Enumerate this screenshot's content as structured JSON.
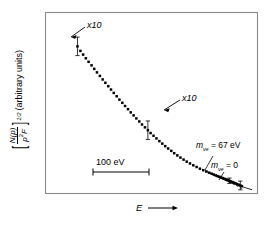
{
  "figure": {
    "type": "kurie-plot",
    "background": "#ffffff",
    "frame_color": "#808080",
    "data_color": "#000000"
  },
  "axes": {
    "y_label_parts": {
      "bracket_open": "[",
      "numerator": "N(p)",
      "denominator_p": "p",
      "denominator_sup": "2",
      "denominator_F": "F",
      "bracket_close": "]",
      "exponent": "1/2",
      "units": "(arbitrary units)"
    },
    "y_label_text": "[ N(p) / p²F ]^(1/2) (arbitrary units)",
    "x_label": "E",
    "x_label_arrow": "⟶"
  },
  "annotations": {
    "multiplier_upper": "x10",
    "multiplier_middle": "x10",
    "scalebar_label": "100 eV",
    "mass_curve_1": {
      "symbol": "m",
      "sub": "ν",
      "subsub": "e",
      "equals": " = 67 eV",
      "text": "mνe = 67 eV"
    },
    "mass_curve_2": {
      "symbol": "m",
      "sub": "ν",
      "subsub": "e",
      "equals": " = 0",
      "text": "mνe = 0"
    }
  },
  "chart_data": {
    "type": "scatter",
    "title": "",
    "xlabel": "E",
    "ylabel": "[N(p)/p²F]^(1/2) (arbitrary units)",
    "grid": false,
    "legend": false,
    "xlim": [
      0,
      100
    ],
    "ylim": [
      0,
      100
    ],
    "points": [
      {
        "x": 10.5,
        "y": 85.5
      },
      {
        "x": 12.0,
        "y": 82.8
      },
      {
        "x": 13.4,
        "y": 80.6
      },
      {
        "x": 14.8,
        "y": 78.4
      },
      {
        "x": 16.2,
        "y": 76.3
      },
      {
        "x": 17.7,
        "y": 74.2
      },
      {
        "x": 19.1,
        "y": 72.1
      },
      {
        "x": 20.5,
        "y": 70.0
      },
      {
        "x": 22.0,
        "y": 67.9
      },
      {
        "x": 23.4,
        "y": 65.8
      },
      {
        "x": 24.8,
        "y": 63.8
      },
      {
        "x": 26.3,
        "y": 61.8
      },
      {
        "x": 27.7,
        "y": 59.8
      },
      {
        "x": 29.1,
        "y": 57.8
      },
      {
        "x": 30.6,
        "y": 55.8
      },
      {
        "x": 32.0,
        "y": 53.8
      },
      {
        "x": 33.5,
        "y": 51.9
      },
      {
        "x": 34.9,
        "y": 50.0
      },
      {
        "x": 36.4,
        "y": 48.1
      },
      {
        "x": 37.8,
        "y": 46.2
      },
      {
        "x": 39.3,
        "y": 44.4
      },
      {
        "x": 40.7,
        "y": 42.6
      },
      {
        "x": 42.2,
        "y": 40.8
      },
      {
        "x": 43.6,
        "y": 39.0
      },
      {
        "x": 45.1,
        "y": 37.3
      },
      {
        "x": 46.6,
        "y": 35.6
      },
      {
        "x": 48.0,
        "y": 33.9
      },
      {
        "x": 49.5,
        "y": 32.3
      },
      {
        "x": 51.0,
        "y": 30.7
      },
      {
        "x": 52.5,
        "y": 29.1
      },
      {
        "x": 54.0,
        "y": 27.6
      },
      {
        "x": 55.5,
        "y": 26.1
      },
      {
        "x": 57.0,
        "y": 24.7
      },
      {
        "x": 58.6,
        "y": 23.3
      },
      {
        "x": 60.1,
        "y": 21.9
      },
      {
        "x": 61.7,
        "y": 20.6
      },
      {
        "x": 63.3,
        "y": 19.3
      },
      {
        "x": 64.9,
        "y": 18.1
      },
      {
        "x": 66.5,
        "y": 16.9
      },
      {
        "x": 68.2,
        "y": 15.8
      },
      {
        "x": 69.9,
        "y": 14.7
      },
      {
        "x": 71.6,
        "y": 13.7
      },
      {
        "x": 73.3,
        "y": 12.7
      },
      {
        "x": 75.0,
        "y": 11.8
      },
      {
        "x": 76.6,
        "y": 11.0
      },
      {
        "x": 78.0,
        "y": 10.3
      },
      {
        "x": 79.3,
        "y": 9.7
      },
      {
        "x": 80.4,
        "y": 9.2
      },
      {
        "x": 81.4,
        "y": 8.7
      },
      {
        "x": 82.3,
        "y": 8.3
      },
      {
        "x": 83.2,
        "y": 7.9
      },
      {
        "x": 84.1,
        "y": 7.5
      },
      {
        "x": 85.0,
        "y": 7.1
      },
      {
        "x": 85.9,
        "y": 6.7
      },
      {
        "x": 86.8,
        "y": 6.3
      },
      {
        "x": 87.6,
        "y": 5.9
      },
      {
        "x": 88.4,
        "y": 5.5
      },
      {
        "x": 89.2,
        "y": 5.1
      },
      {
        "x": 90.0,
        "y": 4.7
      },
      {
        "x": 90.8,
        "y": 4.3
      },
      {
        "x": 91.6,
        "y": 3.9
      },
      {
        "x": 92.4,
        "y": 3.5
      },
      {
        "x": 93.2,
        "y": 3.1
      },
      {
        "x": 94.0,
        "y": 2.7
      },
      {
        "x": 94.8,
        "y": 2.3
      }
    ],
    "error_bars": [
      {
        "x": 10.5,
        "y": 85.5,
        "err": 5.5
      },
      {
        "x": 46.6,
        "y": 35.6,
        "err": 5.5
      },
      {
        "x": 94.0,
        "y": 2.7,
        "err": 2.6
      },
      {
        "x": 88.4,
        "y": 5.5,
        "err": 1.6
      }
    ],
    "curves": [
      {
        "name": "mνe = 67 eV",
        "style": "dashed",
        "points": [
          [
            76.0,
            11.6
          ],
          [
            82.0,
            8.2
          ],
          [
            87.0,
            5.4
          ],
          [
            91.0,
            3.2
          ],
          [
            93.5,
            1.8
          ],
          [
            94.8,
            0.9
          ],
          [
            95.4,
            0.0
          ]
        ]
      },
      {
        "name": "mνe = 0",
        "style": "solid",
        "points": [
          [
            76.0,
            11.4
          ],
          [
            82.0,
            8.0
          ],
          [
            88.0,
            5.0
          ],
          [
            93.0,
            2.8
          ],
          [
            96.5,
            1.4
          ],
          [
            99.0,
            0.5
          ],
          [
            100.0,
            0.15
          ]
        ]
      }
    ]
  }
}
